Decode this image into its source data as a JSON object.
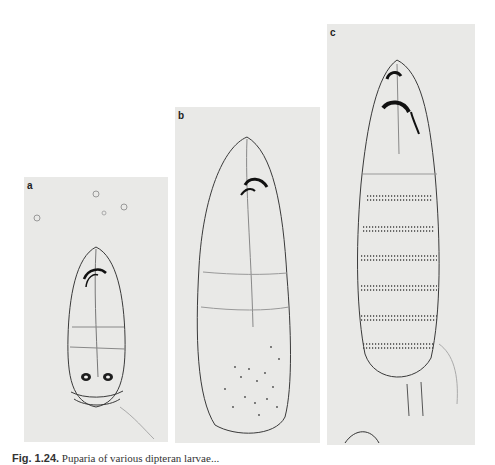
{
  "figure": {
    "panels": [
      {
        "label": "a",
        "description": "Early instar larva, ventral view, with mouth hooks and posterior spiracles"
      },
      {
        "label": "b",
        "description": "Intermediate instar larva with mouth hooks and spiculated posterior region"
      },
      {
        "label": "c",
        "description": "Late instar larva with segmental spicule bands"
      }
    ],
    "caption": {
      "number": "Fig. 1.24.",
      "text": "Puparia of various dipteran larvae..."
    }
  },
  "colors": {
    "panel_background": "#e9e9e7",
    "ink": "#2a2a2a"
  }
}
